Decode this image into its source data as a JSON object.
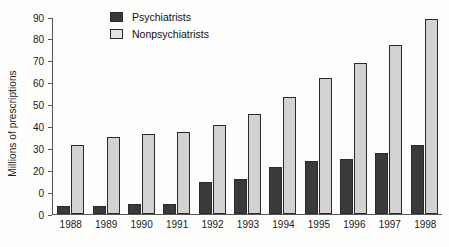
{
  "chart_data": {
    "type": "bar",
    "title": "",
    "xlabel": "",
    "ylabel": "Millions of prescriptions",
    "categories": [
      "1988",
      "1989",
      "1990",
      "1991",
      "1992",
      "1993",
      "1994",
      "1995",
      "1996",
      "1997",
      "1998"
    ],
    "series": [
      {
        "name": "Psychiatrists",
        "color": "#3a3a3a",
        "values": [
          3.5,
          3.5,
          4.5,
          4.5,
          14.5,
          16,
          21.5,
          24,
          25,
          28,
          31.5
        ]
      },
      {
        "name": "Nonpsychiatrists",
        "color": "#d2d2d2",
        "values": [
          31.5,
          35,
          36.5,
          37.5,
          40.5,
          45.5,
          53.5,
          62,
          69,
          77,
          89
        ]
      }
    ],
    "ylim": [
      0,
      90
    ],
    "y_ticks": [
      {
        "value": 90,
        "label": "90"
      },
      {
        "value": 80,
        "label": "80"
      },
      {
        "value": 70,
        "label": "70"
      },
      {
        "value": 60,
        "label": "60"
      },
      {
        "value": 50,
        "label": "50"
      },
      {
        "value": 40,
        "label": "40"
      },
      {
        "value": 30,
        "label": "30"
      },
      {
        "value": 20,
        "label": "20"
      },
      {
        "value": 10,
        "label": "0"
      },
      {
        "value": 0,
        "label": "0"
      }
    ],
    "grid": false,
    "legend_position": "top-left"
  },
  "legend": {
    "entries": [
      {
        "label": "Psychiatrists"
      },
      {
        "label": "Nonpsychiatrists"
      }
    ]
  }
}
